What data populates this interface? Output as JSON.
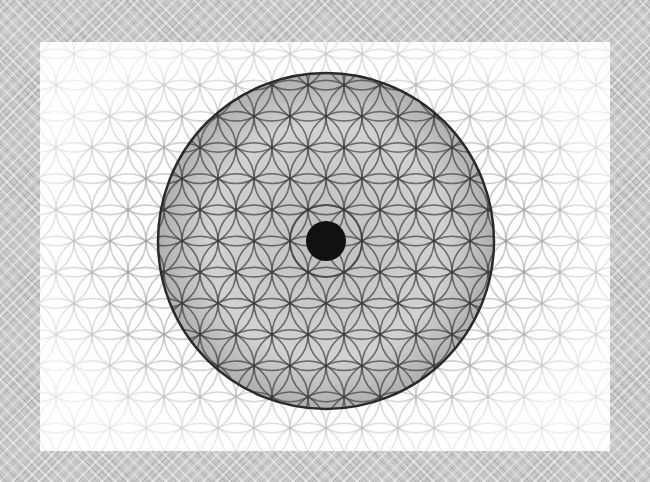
{
  "image": {
    "subject": "Flower of Life sacred geometry pattern",
    "description": "Overlapping circles in a hexagonal grid with a large dark sphere and central black dot, on a white panel over a gray diamond-patterned background",
    "colors": {
      "background": "#c9c9c9",
      "panel": "#fdfdfd",
      "stroke": "#555555",
      "sphere_fill": "#9a9a9a",
      "center_dot": "#111111"
    },
    "geometry": {
      "grid_radius": 36,
      "sphere_center": [
        286,
        199
      ],
      "sphere_radius": 168,
      "center_dot_radius": 20
    }
  }
}
